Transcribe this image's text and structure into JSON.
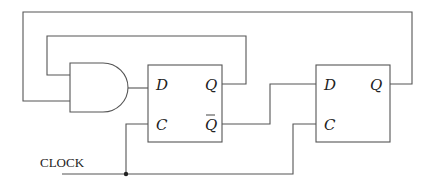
{
  "diagram": {
    "type": "logic-circuit",
    "clock_label": "CLOCK",
    "gates": [
      {
        "type": "AND",
        "inputs": 2
      }
    ],
    "flip_flops": [
      {
        "name": "FF1",
        "pins": {
          "d": "D",
          "c": "C",
          "q": "Q",
          "qbar": "Q"
        }
      },
      {
        "name": "FF2",
        "pins": {
          "d": "D",
          "c": "C",
          "q": "Q"
        }
      }
    ],
    "connections": [
      "FF2.Q -> AND.input2",
      "FF1.Q -> AND.input1",
      "AND.out -> FF1.D",
      "FF1.Qbar -> FF2.D",
      "CLOCK -> FF1.C",
      "CLOCK -> FF2.C"
    ]
  }
}
